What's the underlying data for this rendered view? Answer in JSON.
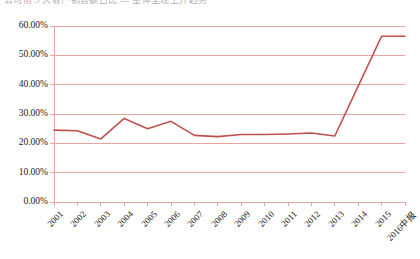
{
  "top_partial_text": "公司前 5 大客户销售额占比 — 整体呈现上升趋势",
  "chart_data": {
    "type": "line",
    "title": "",
    "xlabel": "",
    "ylabel": "",
    "categories": [
      "2001",
      "2002",
      "2003",
      "2004",
      "2005",
      "2006",
      "2007",
      "2008",
      "2009",
      "2010",
      "2011",
      "2012",
      "2013",
      "2014",
      "2015",
      "2016中报"
    ],
    "values": [
      24.5,
      24.3,
      21.5,
      28.5,
      25.0,
      27.5,
      22.7,
      22.3,
      23.0,
      23.0,
      23.2,
      23.5,
      22.5,
      39.5,
      56.5,
      56.5
    ],
    "series": [
      {
        "name": "占比",
        "color": "#C0504D",
        "values": [
          24.5,
          24.3,
          21.5,
          28.5,
          25.0,
          27.5,
          22.7,
          22.3,
          23.0,
          23.0,
          23.2,
          23.5,
          22.5,
          39.5,
          56.5,
          56.5
        ]
      }
    ],
    "ylim": [
      0,
      60
    ],
    "ytick_values": [
      0,
      10,
      20,
      30,
      40,
      50,
      60
    ],
    "ytick_labels": [
      "0.00%",
      "10.00%",
      "20.00%",
      "30.00%",
      "40.00%",
      "50.00%",
      "60.00%"
    ],
    "grid": true,
    "grid_color": "#E8A79E",
    "legend": false,
    "legend_position": "none",
    "plot_border_color": "#E8A79E",
    "background": "#FFFFFF",
    "value_format": "percent"
  }
}
